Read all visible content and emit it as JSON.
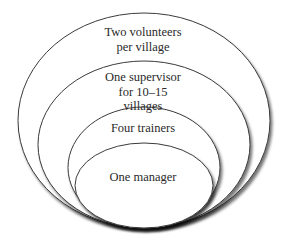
{
  "diagram": {
    "type": "nested-ellipses",
    "colors": {
      "background": "#ffffff",
      "stroke": "#3a3a3a",
      "fill": "#ffffff",
      "shadow": "#777777",
      "text": "#2a2a2a"
    },
    "levels": [
      {
        "name": "volunteers",
        "lines": [
          "Two volunteers",
          "per village"
        ]
      },
      {
        "name": "supervisor",
        "lines": [
          "One supervisor",
          "for 10–15",
          "villages"
        ]
      },
      {
        "name": "trainers",
        "lines": [
          "Four trainers"
        ]
      },
      {
        "name": "manager",
        "lines": [
          "One manager"
        ]
      }
    ]
  }
}
